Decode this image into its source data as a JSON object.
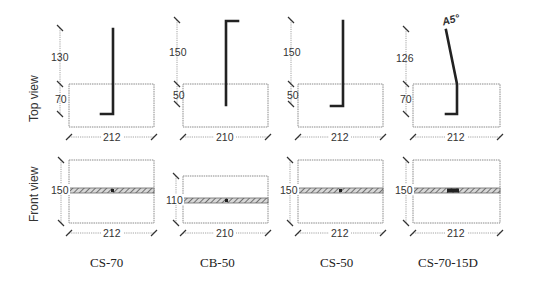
{
  "row_labels": {
    "top": "Top view",
    "front": "Front view"
  },
  "specimens": [
    {
      "id": "CS-70",
      "caption": "CS-70",
      "top": {
        "embed_len": "130",
        "depth": "70",
        "width": "212"
      },
      "front": {
        "height": "150",
        "width": "212"
      }
    },
    {
      "id": "CB-50",
      "caption": "CB-50",
      "top": {
        "embed_len": "150",
        "depth": "50",
        "width": "210"
      },
      "front": {
        "height": "110",
        "width": "210"
      }
    },
    {
      "id": "CS-50",
      "caption": "CS-50",
      "top": {
        "embed_len": "150",
        "depth": "50",
        "width": "212"
      },
      "front": {
        "height": "150",
        "width": "212"
      }
    },
    {
      "id": "CS-70-15D",
      "caption": "CS-70-15D",
      "top": {
        "embed_len": "126",
        "depth": "70",
        "width": "212",
        "angle": "A5°"
      },
      "front": {
        "height": "150",
        "width": "212"
      }
    }
  ],
  "colors": {
    "bar": "#222222",
    "outline": "#8a8a8a",
    "hatch": "#6a6a6a"
  }
}
